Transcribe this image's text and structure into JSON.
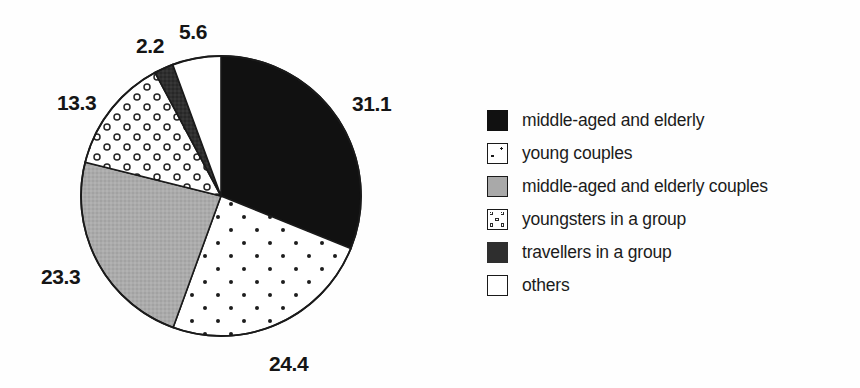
{
  "chart_data": {
    "type": "pie",
    "title": "",
    "subtitle": "",
    "xlabel": "",
    "ylabel": "",
    "grid": false,
    "legend_position": "right",
    "units": "percent",
    "total": 99.9,
    "start_angle_deg": 0,
    "direction": "clockwise",
    "categories": [
      "middle-aged and elderly",
      "young couples",
      "middle-aged and elderly couples",
      "youngsters in a group",
      "travellers in a group",
      "others"
    ],
    "values": [
      31.1,
      24.4,
      23.3,
      13.3,
      2.2,
      5.6
    ],
    "labels": [
      "31.1",
      "24.4",
      "23.3",
      "13.3",
      "2.2",
      "5.6"
    ],
    "slice_fills": [
      "solid-black",
      "fine-dots",
      "gray",
      "rings",
      "dark-gray",
      "white"
    ],
    "slice_colors": [
      "#111111",
      "#ffffff",
      "#a9a9a9",
      "#ffffff",
      "#2e2e2e",
      "#ffffff"
    ]
  },
  "pie": {
    "center_x": 221,
    "center_y": 196,
    "radius": 140,
    "outline_color": "#1a1a1a",
    "slices": [
      {
        "key": "middle-aged-and-elderly",
        "label": "31.1",
        "value": 31.1,
        "fill": "solid-black"
      },
      {
        "key": "young-couples",
        "label": "24.4",
        "value": 24.4,
        "fill": "fine-dots"
      },
      {
        "key": "middle-aged-and-elderly-couples",
        "label": "23.3",
        "value": 23.3,
        "fill": "gray"
      },
      {
        "key": "youngsters-in-a-group",
        "label": "13.3",
        "value": 13.3,
        "fill": "rings"
      },
      {
        "key": "travellers-in-a-group",
        "label": "2.2",
        "value": 2.2,
        "fill": "dark-gray"
      },
      {
        "key": "others",
        "label": "5.6",
        "value": 5.6,
        "fill": "white"
      }
    ]
  },
  "value_labels": [
    {
      "key": "label-31-1",
      "text": "31.1",
      "left": 352,
      "top": 93
    },
    {
      "key": "label-24-4",
      "text": "24.4",
      "left": 269,
      "top": 353
    },
    {
      "key": "label-23-3",
      "text": "23.3",
      "left": 41,
      "top": 266
    },
    {
      "key": "label-13-3",
      "text": "13.3",
      "left": 57,
      "top": 92
    },
    {
      "key": "label-2-2",
      "text": "2.2",
      "left": 136,
      "top": 35
    },
    {
      "key": "label-5-6",
      "text": "5.6",
      "left": 179,
      "top": 21
    }
  ],
  "legend": {
    "items": [
      {
        "key": "middle-aged-and-elderly",
        "label": "middle-aged and elderly",
        "swatch": "solid-black",
        "color": "#111111"
      },
      {
        "key": "young-couples",
        "label": "young couples",
        "swatch": "fine-dots",
        "color": "#ffffff"
      },
      {
        "key": "middle-aged-and-elderly-couples",
        "label": "middle-aged and elderly couples",
        "swatch": "gray",
        "color": "#a9a9a9"
      },
      {
        "key": "youngsters-in-a-group",
        "label": "youngsters in a group",
        "swatch": "rings",
        "color": "#ffffff"
      },
      {
        "key": "travellers-in-a-group",
        "label": "travellers in a group",
        "swatch": "dark-gray",
        "color": "#2e2e2e"
      },
      {
        "key": "others",
        "label": "others",
        "swatch": "white",
        "color": "#ffffff"
      }
    ]
  }
}
